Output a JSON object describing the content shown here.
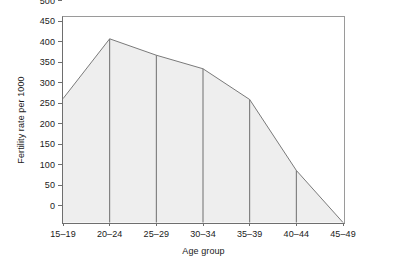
{
  "chart_data": {
    "type": "area",
    "title": "",
    "subtitle": "",
    "xlabel": "Age group",
    "ylabel": "Fertility rate per 1000",
    "categories": [
      "15–19",
      "20–24",
      "25–29",
      "30–34",
      "35–39",
      "40–44",
      "45–49"
    ],
    "values": [
      302,
      448,
      408,
      375,
      300,
      127,
      0
    ],
    "series": [
      {
        "name": "Fertility rate per 1000",
        "values": [
          302,
          448,
          408,
          375,
          300,
          127,
          0
        ]
      }
    ],
    "ylim": [
      0,
      500
    ],
    "ytick_values": [
      0,
      50,
      100,
      150,
      200,
      250,
      300,
      350,
      400,
      450,
      500
    ],
    "ytick_labels": [
      "0",
      "50",
      "100",
      "150",
      "200",
      "250",
      "300",
      "350",
      "400",
      "450",
      "500"
    ],
    "grid": false,
    "vertical_droplines": true,
    "legend": "none",
    "legend_position": "none",
    "colors": {
      "area_fill": "#eeeeee",
      "line": "#7a7a7a",
      "dropline": "#6e6e6e",
      "axis": "#6e6e6e",
      "frame": "#9a9a9a",
      "text": "#1a1a1a",
      "background": "#ffffff"
    }
  }
}
